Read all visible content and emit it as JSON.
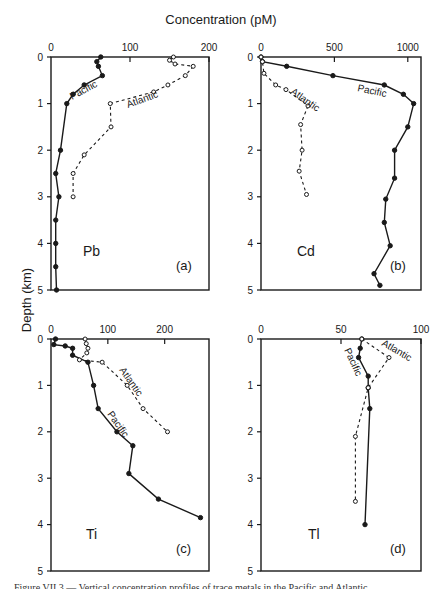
{
  "figure": {
    "title": "Concentration (pM)",
    "ylabel": "Depth (km)",
    "caption": "Figure VII.3 — Vertical concentration profiles of trace metals in the Pacific and Atlantic",
    "colors": {
      "line": "#1a1a1a",
      "background": "#ffffff"
    }
  },
  "chart_data": [
    {
      "type": "line",
      "panel": "(a)",
      "element": "Pb",
      "xlabel": "Concentration (pM)",
      "ylabel": "Depth (km)",
      "xticks": [
        0,
        100,
        200
      ],
      "yticks": [
        0,
        1,
        2,
        3,
        4,
        5
      ],
      "xlim": [
        0,
        200
      ],
      "ylim": [
        5,
        0
      ],
      "grid": false,
      "series": [
        {
          "name": "Pacific",
          "style": "solid-filled",
          "points": [
            [
              63,
              0
            ],
            [
              58,
              0.1
            ],
            [
              60,
              0.2
            ],
            [
              65,
              0.4
            ],
            [
              42,
              0.6
            ],
            [
              28,
              0.8
            ],
            [
              20,
              1.0
            ],
            [
              12,
              2.0
            ],
            [
              6,
              2.5
            ],
            [
              10,
              3.0
            ],
            [
              6,
              3.5
            ],
            [
              6,
              4.0
            ],
            [
              6,
              4.5
            ],
            [
              7,
              5.0
            ]
          ]
        },
        {
          "name": "Atlantic",
          "style": "dashed-open",
          "points": [
            [
              155,
              0
            ],
            [
              150,
              0.07
            ],
            [
              157,
              0.15
            ],
            [
              180,
              0.2
            ],
            [
              170,
              0.4
            ],
            [
              148,
              0.6
            ],
            [
              130,
              0.75
            ],
            [
              75,
              1.0
            ],
            [
              76,
              1.5
            ],
            [
              42,
              2.1
            ],
            [
              28,
              2.5
            ],
            [
              28,
              3.0
            ]
          ]
        }
      ]
    },
    {
      "type": "line",
      "panel": "(b)",
      "element": "Cd",
      "xlabel": "Concentration (pM)",
      "ylabel": "Depth (km)",
      "xticks": [
        0,
        500,
        1000
      ],
      "yticks": [
        0,
        1,
        2,
        3,
        4,
        5
      ],
      "xlim": [
        0,
        1090
      ],
      "ylim": [
        5,
        0
      ],
      "grid": false,
      "series": [
        {
          "name": "Pacific",
          "style": "solid-filled",
          "points": [
            [
              0,
              0
            ],
            [
              10,
              0.1
            ],
            [
              175,
              0.2
            ],
            [
              490,
              0.4
            ],
            [
              840,
              0.6
            ],
            [
              970,
              0.8
            ],
            [
              1040,
              1.0
            ],
            [
              1000,
              1.5
            ],
            [
              910,
              2.0
            ],
            [
              910,
              2.6
            ],
            [
              850,
              3.05
            ],
            [
              840,
              3.55
            ],
            [
              880,
              4.05
            ],
            [
              770,
              4.65
            ],
            [
              810,
              4.9
            ]
          ]
        },
        {
          "name": "Atlantic",
          "style": "dashed-open",
          "points": [
            [
              0,
              0
            ],
            [
              10,
              0.1
            ],
            [
              20,
              0.35
            ],
            [
              100,
              0.6
            ],
            [
              170,
              0.7
            ],
            [
              320,
              1.05
            ],
            [
              270,
              1.45
            ],
            [
              280,
              2.0
            ],
            [
              260,
              2.45
            ],
            [
              310,
              2.95
            ]
          ]
        }
      ]
    },
    {
      "type": "line",
      "panel": "(c)",
      "element": "Ti",
      "xlabel": "Concentration (pM)",
      "ylabel": "Depth (km)",
      "xticks": [
        0,
        100,
        200
      ],
      "yticks": [
        0,
        1,
        2,
        3,
        4,
        5
      ],
      "xlim": [
        0,
        278
      ],
      "ylim": [
        5,
        0
      ],
      "grid": false,
      "series": [
        {
          "name": "Pacific",
          "style": "solid-filled",
          "points": [
            [
              8,
              0
            ],
            [
              5,
              0.12
            ],
            [
              25,
              0.15
            ],
            [
              38,
              0.2
            ],
            [
              38,
              0.35
            ],
            [
              65,
              0.5
            ],
            [
              75,
              1.0
            ],
            [
              83,
              1.5
            ],
            [
              116,
              2.0
            ],
            [
              144,
              2.3
            ],
            [
              137,
              2.9
            ],
            [
              189,
              3.45
            ],
            [
              263,
              3.85
            ]
          ]
        },
        {
          "name": "Atlantic",
          "style": "dashed-open",
          "points": [
            [
              60,
              0
            ],
            [
              62,
              0.1
            ],
            [
              65,
              0.2
            ],
            [
              63,
              0.3
            ],
            [
              50,
              0.45
            ],
            [
              90,
              0.5
            ],
            [
              134,
              1.0
            ],
            [
              162,
              1.5
            ],
            [
              205,
              2.0
            ]
          ]
        }
      ]
    },
    {
      "type": "line",
      "panel": "(d)",
      "element": "Tl",
      "xlabel": "Concentration (pM)",
      "ylabel": "Depth (km)",
      "xticks": [
        0,
        50,
        100
      ],
      "yticks": [
        0,
        1,
        2,
        3,
        4,
        5
      ],
      "xlim": [
        0,
        100
      ],
      "ylim": [
        5,
        0
      ],
      "grid": false,
      "series": [
        {
          "name": "Pacific",
          "style": "solid-filled",
          "points": [
            [
              63,
              0
            ],
            [
              62,
              0.2
            ],
            [
              61,
              0.4
            ],
            [
              67,
              0.8
            ],
            [
              67,
              1.05
            ],
            [
              68,
              1.5
            ],
            [
              65,
              4.0
            ]
          ]
        },
        {
          "name": "Atlantic",
          "style": "dashed-open",
          "points": [
            [
              63,
              0
            ],
            [
              80,
              0.4
            ],
            [
              67,
              1.05
            ],
            [
              59,
              2.1
            ],
            [
              59,
              3.5
            ]
          ]
        }
      ]
    }
  ],
  "layout": {
    "panels": [
      {
        "x0": 51,
        "x1": 209,
        "y0": 57,
        "y1": 290,
        "idx": 0,
        "pac_label": {
          "x": 72,
          "y": 100,
          "rot": -28
        },
        "atl_label": {
          "x": 128,
          "y": 108,
          "rot": -20
        },
        "elem_pos": {
          "x": 83,
          "y": 256
        },
        "id_pos": {
          "x": 176,
          "y": 270
        }
      },
      {
        "x0": 261,
        "x1": 421,
        "y0": 57,
        "y1": 290,
        "idx": 1,
        "pac_label": {
          "x": 357,
          "y": 91,
          "rot": 12
        },
        "atl_label": {
          "x": 290,
          "y": 93,
          "rot": 35
        },
        "elem_pos": {
          "x": 297,
          "y": 256
        },
        "id_pos": {
          "x": 390,
          "y": 270
        }
      },
      {
        "x0": 51,
        "x1": 209,
        "y0": 339,
        "y1": 571,
        "idx": 2,
        "pac_label": {
          "x": 107,
          "y": 414,
          "rot": 55
        },
        "atl_label": {
          "x": 119,
          "y": 370,
          "rot": 55
        },
        "elem_pos": {
          "x": 86,
          "y": 539
        },
        "id_pos": {
          "x": 176,
          "y": 553
        }
      },
      {
        "x0": 261,
        "x1": 421,
        "y0": 339,
        "y1": 571,
        "idx": 3,
        "pac_label": {
          "x": 344,
          "y": 350,
          "rot": 65
        },
        "atl_label": {
          "x": 381,
          "y": 345,
          "rot": 30
        },
        "elem_pos": {
          "x": 308,
          "y": 539
        },
        "id_pos": {
          "x": 390,
          "y": 553
        }
      }
    ]
  }
}
